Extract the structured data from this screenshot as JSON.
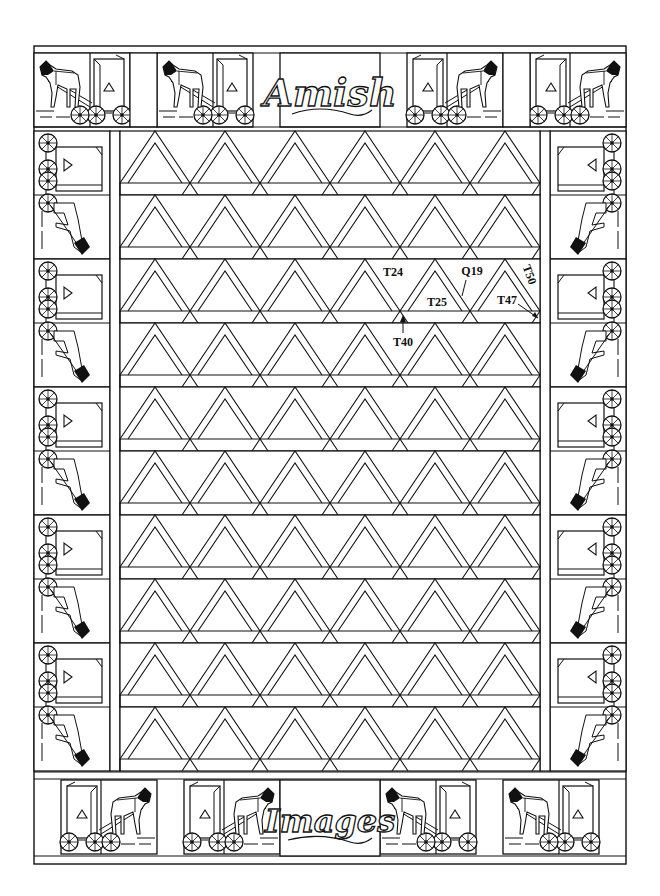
{
  "quilt": {
    "title_top": "Amish",
    "title_bottom": "Images",
    "line_color": "#111111",
    "background": "#ffffff",
    "grid": {
      "rows": 10,
      "triangles_per_row": 6
    },
    "border_motif": "horse-and-buggy",
    "top_blocks": [
      "buggy-left",
      "buggy-left",
      "title-amish",
      "buggy-right",
      "buggy-right"
    ],
    "bottom_blocks": [
      "buggy-left-mirror",
      "buggy-left-mirror",
      "title-images",
      "buggy-right-mirror",
      "buggy-right-mirror"
    ],
    "side_blocks_per_column": 5
  },
  "labels": [
    {
      "id": "T24",
      "text": "T24"
    },
    {
      "id": "Q19",
      "text": "Q19"
    },
    {
      "id": "T50",
      "text": "T50"
    },
    {
      "id": "T25",
      "text": "T25"
    },
    {
      "id": "T47",
      "text": "T47"
    },
    {
      "id": "T40",
      "text": "T40"
    }
  ]
}
